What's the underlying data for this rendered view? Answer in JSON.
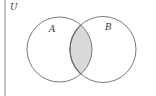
{
  "diagram": {
    "type": "venn",
    "universe_label": "U",
    "sets": [
      {
        "name": "A",
        "label": "A"
      },
      {
        "name": "B",
        "label": "B"
      }
    ],
    "shaded_region": "A ∩ B",
    "colors": {
      "outline": "#7a7a7a",
      "border": "#8a8a8a",
      "shade": "#d9d9d9",
      "lens_outline": "#6a6a6a",
      "background": "#ffffff"
    }
  }
}
